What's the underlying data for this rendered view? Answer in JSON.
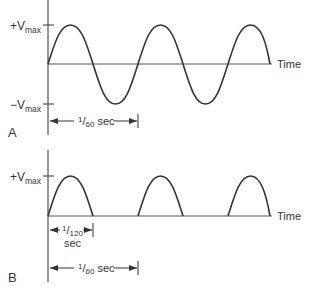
{
  "panel_a": {
    "letter": "A",
    "pos_label_main": "+V",
    "pos_label_sub": "max",
    "neg_label_main": "−V",
    "neg_label_sub": "max",
    "axis_label": "Time",
    "period_num": "1",
    "period_den": "60",
    "period_unit": " sec",
    "waveform": "full sine wave, 3 cycles"
  },
  "panel_b": {
    "letter": "B",
    "pos_label_main": "+V",
    "pos_label_sub": "max",
    "axis_label": "Time",
    "half_num": "1",
    "half_den": "120",
    "half_unit": "sec",
    "period_num": "1",
    "period_den": "60",
    "period_unit": " sec",
    "waveform": "half-wave rectified sine, 3 pulses"
  },
  "colors": {
    "line": "#333333",
    "background": "#ffffff"
  }
}
